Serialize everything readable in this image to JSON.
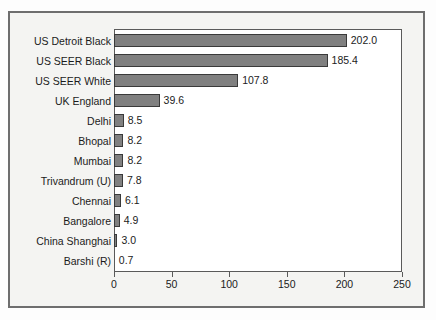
{
  "chart_data": {
    "type": "bar",
    "orientation": "horizontal",
    "title": "",
    "subtitle": "",
    "xlabel": "",
    "ylabel": "",
    "xlim": [
      0,
      250
    ],
    "grid": false,
    "legend": null,
    "xticks": [
      "0",
      "50",
      "100",
      "150",
      "200",
      "250"
    ],
    "xtick_values": [
      0,
      50,
      100,
      150,
      200,
      250
    ],
    "categories": [
      "US Detroit Black",
      "US SEER Black",
      "US SEER White",
      "UK England",
      "Delhi",
      "Bhopal",
      "Mumbai",
      "Trivandrum (U)",
      "Chennai",
      "Bangalore",
      "China Shanghai",
      "Barshi (R)"
    ],
    "values": [
      202.0,
      185.4,
      107.8,
      39.6,
      8.5,
      8.2,
      8.2,
      7.8,
      6.1,
      4.9,
      3.0,
      0.7
    ],
    "value_labels": [
      "202.0",
      "185.4",
      "107.8",
      "39.6",
      "8.5",
      "8.2",
      "8.2",
      "7.8",
      "6.1",
      "4.9",
      "3.0",
      "0.7"
    ],
    "bar_color": "#808080",
    "bar_border_color": "#3a3a3a",
    "plot_background": "#ffffff",
    "figure_background": "#f4f4f2",
    "frame_color": "#6e6e6e"
  }
}
